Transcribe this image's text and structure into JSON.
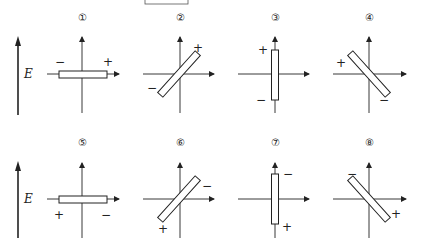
{
  "field_label": "E",
  "panels": [
    {
      "label": "①",
      "orientation": "horizontal",
      "plus": "+",
      "minus": "−",
      "plus_pos": "upper-right",
      "minus_pos": "upper-left"
    },
    {
      "label": "②",
      "orientation": "diagonal-up",
      "plus": "+",
      "minus": "−",
      "plus_pos": "upper-right",
      "minus_pos": "lower-left"
    },
    {
      "label": "③",
      "orientation": "vertical",
      "plus": "+",
      "minus": "−",
      "plus_pos": "upper-left",
      "minus_pos": "lower-left"
    },
    {
      "label": "④",
      "orientation": "diagonal-down",
      "plus": "+",
      "minus": "−",
      "plus_pos": "upper-left",
      "minus_pos": "lower-right"
    },
    {
      "label": "⑤",
      "orientation": "horizontal",
      "plus": "+",
      "minus": "−",
      "plus_pos": "lower-left",
      "minus_pos": "lower-right"
    },
    {
      "label": "⑥",
      "orientation": "diagonal-up",
      "plus": "+",
      "minus": "−",
      "plus_pos": "lower-left",
      "minus_pos": "upper-right"
    },
    {
      "label": "⑦",
      "orientation": "vertical",
      "plus": "+",
      "minus": "−",
      "plus_pos": "lower-right",
      "minus_pos": "upper-right"
    },
    {
      "label": "⑧",
      "orientation": "diagonal-down",
      "plus": "+",
      "minus": "−",
      "plus_pos": "lower-right",
      "minus_pos": "upper-left"
    }
  ]
}
